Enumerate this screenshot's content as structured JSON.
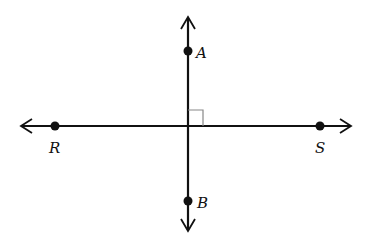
{
  "diagram": {
    "points": [
      {
        "name": "A",
        "label": "A"
      },
      {
        "name": "B",
        "label": "B"
      },
      {
        "name": "R",
        "label": "R"
      },
      {
        "name": "S",
        "label": "S"
      }
    ],
    "lines": [
      {
        "name": "line-RS",
        "through": [
          "R",
          "S"
        ],
        "orientation": "horizontal",
        "arrows": "both"
      },
      {
        "name": "line-AB",
        "through": [
          "A",
          "B"
        ],
        "orientation": "vertical",
        "arrows": "both"
      }
    ],
    "right_angle_marker": true,
    "colors": {
      "stroke": "#111111",
      "marker": "#888888",
      "background": "#ffffff"
    }
  }
}
